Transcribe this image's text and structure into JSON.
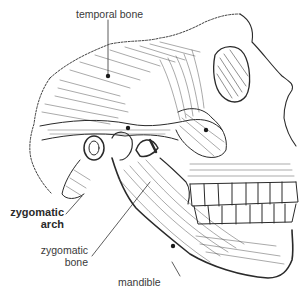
{
  "figure": {
    "labels": {
      "temporal_bone": "temporal bone",
      "zygomatic_arch_line1": "zygomatic",
      "zygomatic_arch_line2": "arch",
      "zygomatic_bone_line1": "zygomatic",
      "zygomatic_bone_line2": "bone",
      "mandible": "mandible"
    },
    "colors": {
      "ink": "#2a2a2a",
      "label_text": "#3a3a3a",
      "background": "#ffffff"
    }
  }
}
